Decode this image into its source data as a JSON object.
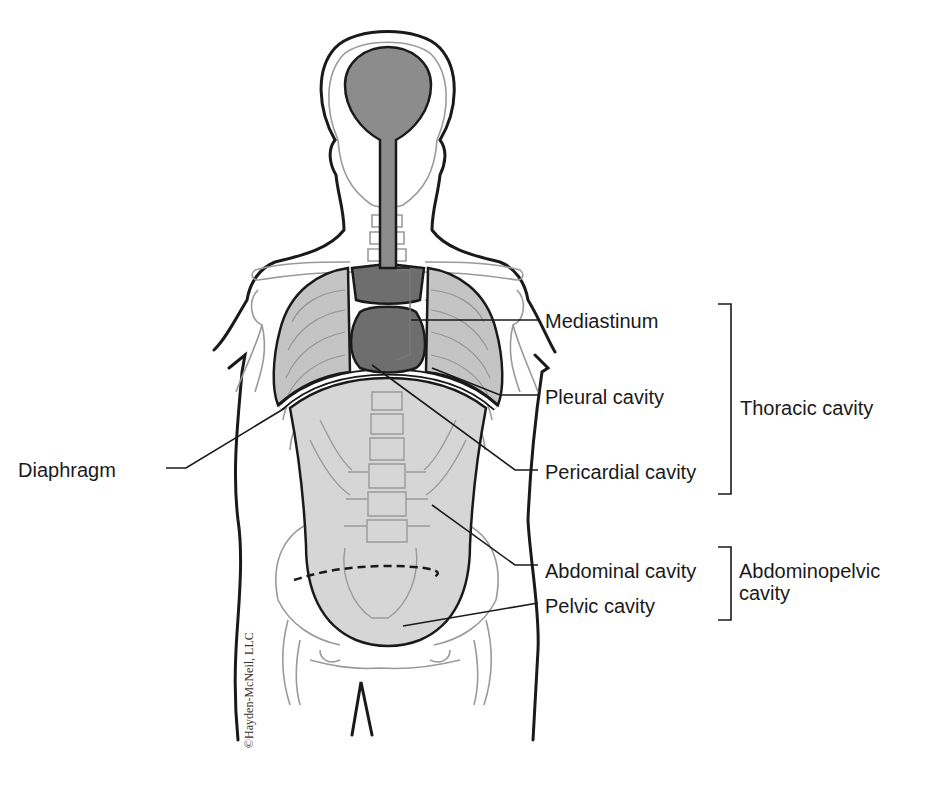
{
  "diagram": {
    "labels": {
      "mediastinum": "Mediastinum",
      "pleural_cavity": "Pleural cavity",
      "pericardial_cavity": "Pericardial cavity",
      "diaphragm": "Diaphragm",
      "abdominal_cavity": "Abdominal cavity",
      "pelvic_cavity": "Pelvic cavity"
    },
    "groups": {
      "thoracic_cavity": "Thoracic cavity",
      "abdominopelvic_line1": "Abdominopelvic",
      "abdominopelvic_line2": "cavity"
    },
    "copyright": "©Hayden-McNeil, LLC",
    "colors": {
      "outline": "#1a1a1a",
      "bone": "#9a9a9a",
      "dorsal_cavity": "#8c8c8c",
      "heart_mediastinum": "#6e6e6e",
      "lungs": "#c4c4c4",
      "abdominopelvic": "#d6d6d6"
    }
  }
}
